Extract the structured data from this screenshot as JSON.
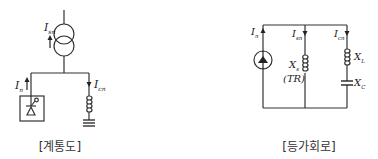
{
  "figures": [
    {
      "id": "system-diagram",
      "caption": "[계통도]",
      "labels": {
        "transformer_current": {
          "main": "I",
          "sub": "sn"
        },
        "source_current": {
          "main": "I",
          "sub": "n"
        },
        "reactor_current": {
          "main": "I",
          "sub": "cn"
        }
      }
    },
    {
      "id": "equivalent-circuit",
      "caption": "[등가회로]",
      "labels": {
        "source_current": {
          "main": "I",
          "sub": "n"
        },
        "transformer_branch_current": {
          "main": "I",
          "sub": "sn"
        },
        "filter_branch_current": {
          "main": "I",
          "sub": "cn"
        },
        "transformer_reactance": {
          "main": "X",
          "sub": "s"
        },
        "transformer_tag": "(TR)",
        "inductor_reactance": {
          "main": "X",
          "sub": "L"
        },
        "capacitor_reactance": {
          "main": "X",
          "sub": "C"
        }
      }
    }
  ]
}
